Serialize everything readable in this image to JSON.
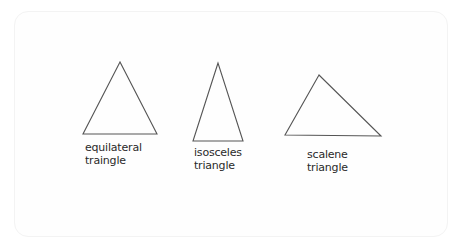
{
  "diagram": {
    "triangles": [
      {
        "type": "equilateral",
        "label_line1": "equilateral",
        "label_line2": "traingle",
        "points": "120,62 83,134 157,134"
      },
      {
        "type": "isosceles",
        "label_line1": "isosceles",
        "label_line2": "triangle",
        "points": "218,63 193,141 243,141"
      },
      {
        "type": "scalene",
        "label_line1": "scalene",
        "label_line2": "triangle",
        "points": "319,75 285,135 381,136"
      }
    ],
    "stroke_color": "#4a4a4a"
  }
}
